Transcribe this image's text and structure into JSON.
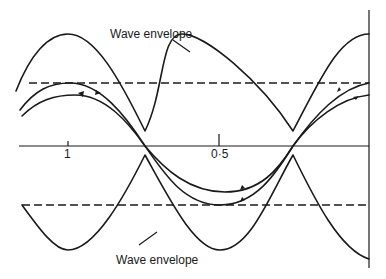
{
  "figure": {
    "labels": {
      "upper_envelope": "Wave envelope",
      "lower_envelope": "Wave envelope"
    },
    "axis": {
      "tick_1": "1",
      "tick_0_5": "0·5"
    },
    "elements": {
      "horizontal_axis": "standing-wave axis",
      "right_boundary": "vertical reflecting boundary",
      "upper_dashed_line": "upper reference level",
      "lower_dashed_line": "lower reference level",
      "upper_envelope_curve": "rectified wave envelope (upper)",
      "lower_envelope_curve": "rectified wave envelope (lower)",
      "wave_curves": "two instantaneous wave traces with direction arrows"
    },
    "colors": {
      "ink": "#1a1a1a",
      "background": "#ffffff"
    }
  }
}
